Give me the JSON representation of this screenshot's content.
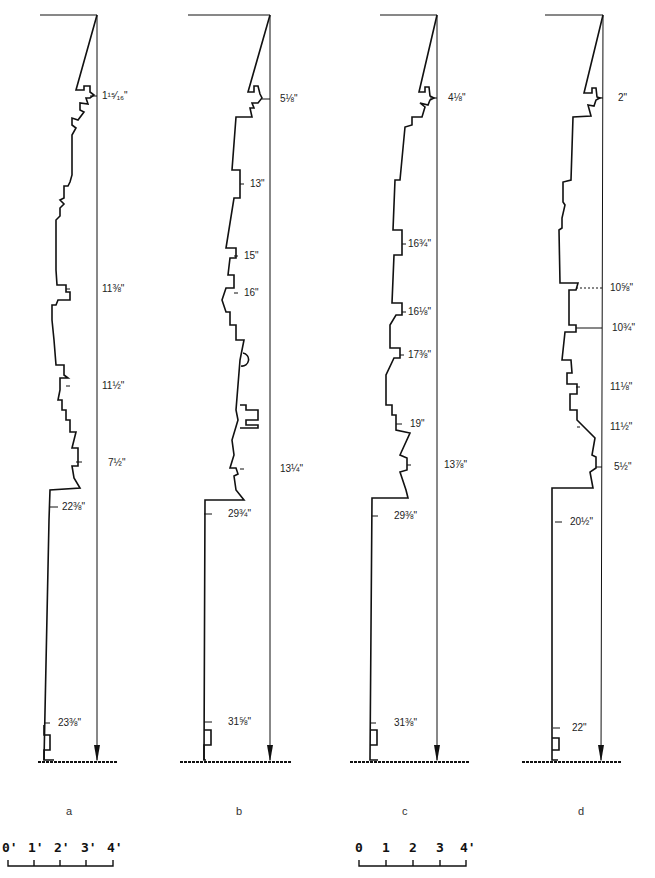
{
  "figure": {
    "profiles": [
      {
        "id": "a",
        "caption": "a",
        "dimensions": [
          "1¹⁵⁄₁₆\"",
          "11⅜\"",
          "11½\"",
          "7½\"",
          "22⅜\"",
          "23⅜\""
        ]
      },
      {
        "id": "b",
        "caption": "b",
        "dimensions": [
          "5⅛\"",
          "13\"",
          "15\"",
          "16\"",
          "13¼\"",
          "29¾\"",
          "31⅝\""
        ]
      },
      {
        "id": "c",
        "caption": "c",
        "dimensions": [
          "4⅛\"",
          "16¾\"",
          "16⅛\"",
          "17⅜\"",
          "19\"",
          "13⅞\"",
          "29⅜\"",
          "31⅜\""
        ]
      },
      {
        "id": "d",
        "caption": "d",
        "dimensions": [
          "2\"",
          "10⅝\"",
          "10¾\"",
          "11⅛\"",
          "11½\"",
          "5½\"",
          "20½\"",
          "22\""
        ]
      }
    ],
    "scales": [
      {
        "labels": [
          "0'",
          "1'",
          "2'",
          "3'",
          "4'"
        ]
      },
      {
        "labels": [
          "0",
          "1",
          "2",
          "3",
          "4'"
        ]
      }
    ]
  }
}
